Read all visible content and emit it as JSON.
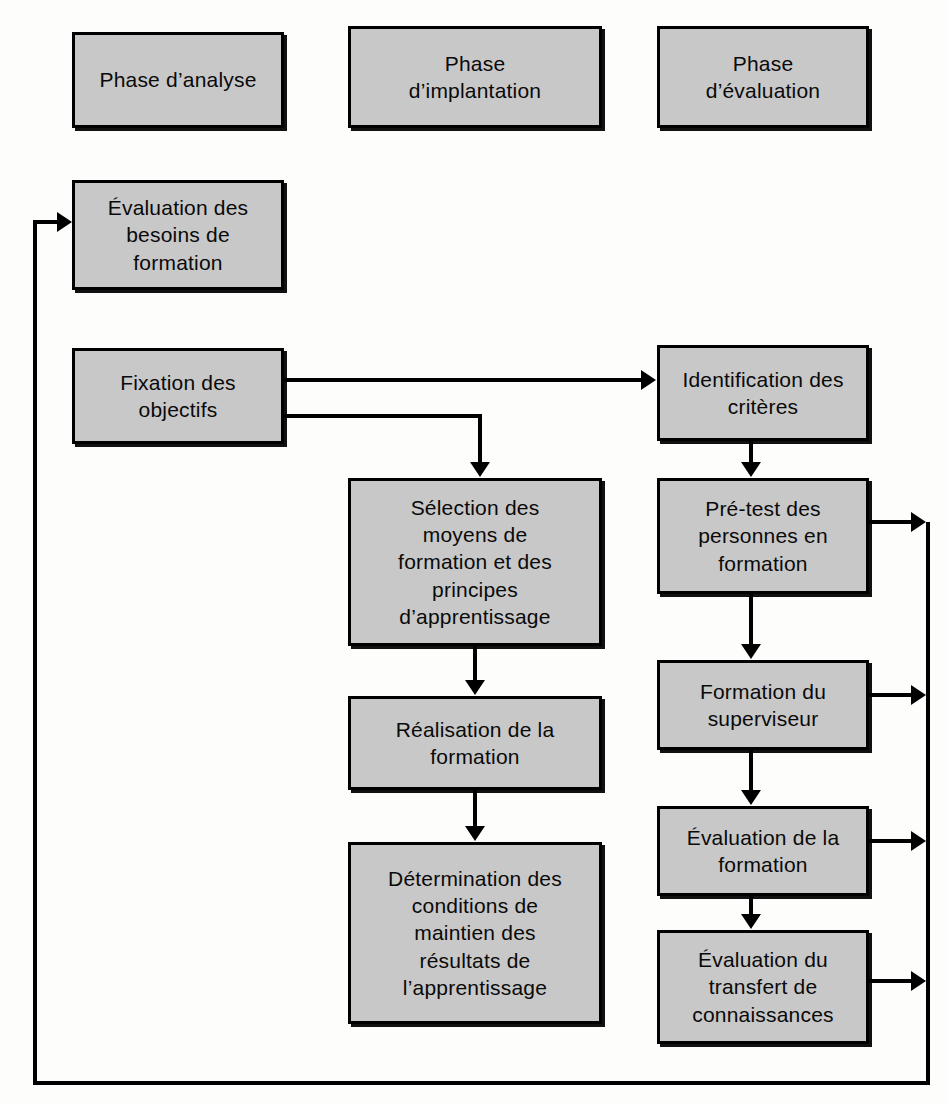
{
  "diagram": {
    "background_color": "#fdfdfb",
    "node_fill_color": "#c8c8c8",
    "node_border_color": "#000000",
    "connector_color": "#000000"
  },
  "headers": [
    {
      "id": "phase-analyse",
      "label": "Phase d’analyse"
    },
    {
      "id": "phase-implantation",
      "label": "Phase\nd’implantation"
    },
    {
      "id": "phase-evaluation",
      "label": "Phase\nd’évaluation"
    }
  ],
  "columns": {
    "analyse": [
      {
        "id": "evaluation-besoins",
        "label": "Évaluation des\nbesoins de\nformation"
      },
      {
        "id": "fixation-objectifs",
        "label": "Fixation des\nobjectifs"
      }
    ],
    "implantation": [
      {
        "id": "selection-moyens",
        "label": "Sélection des\nmoyens de\nformation et des\nprincipes\nd’apprentissage"
      },
      {
        "id": "realisation",
        "label": "Réalisation de la\nformation"
      },
      {
        "id": "determination",
        "label": "Détermination des\nconditions de\nmaintien des\nrésultats de\nl’apprentissage"
      }
    ],
    "evaluation": [
      {
        "id": "identification-criteres",
        "label": "Identification des\ncritères"
      },
      {
        "id": "pre-test",
        "label": "Pré-test des\npersonnes en\nformation"
      },
      {
        "id": "formation-superviseur",
        "label": "Formation du\nsuperviseur"
      },
      {
        "id": "evaluation-formation",
        "label": "Évaluation de la\nformation"
      },
      {
        "id": "evaluation-transfert",
        "label": "Évaluation du\ntransfert de\nconnaissances"
      }
    ]
  },
  "connections": [
    {
      "from": "fixation-objectifs",
      "to": "identification-criteres",
      "type": "straight-right"
    },
    {
      "from": "fixation-objectifs",
      "to": "selection-moyens",
      "type": "elbow-right-down"
    },
    {
      "from": "selection-moyens",
      "to": "realisation",
      "type": "straight-down"
    },
    {
      "from": "realisation",
      "to": "determination",
      "type": "straight-down"
    },
    {
      "from": "identification-criteres",
      "to": "pre-test",
      "type": "straight-down"
    },
    {
      "from": "pre-test",
      "to": "formation-superviseur",
      "type": "straight-down"
    },
    {
      "from": "formation-superviseur",
      "to": "evaluation-formation",
      "type": "straight-down"
    },
    {
      "from": "evaluation-formation",
      "to": "evaluation-transfert",
      "type": "straight-down"
    },
    {
      "from": "pre-test",
      "to": "feedback-bus",
      "type": "straight-right"
    },
    {
      "from": "formation-superviseur",
      "to": "feedback-bus",
      "type": "straight-right"
    },
    {
      "from": "evaluation-formation",
      "to": "feedback-bus",
      "type": "straight-right"
    },
    {
      "from": "evaluation-transfert",
      "to": "feedback-bus",
      "type": "straight-right"
    },
    {
      "from": "feedback-bus",
      "to": "evaluation-besoins",
      "type": "feedback-loop"
    }
  ]
}
